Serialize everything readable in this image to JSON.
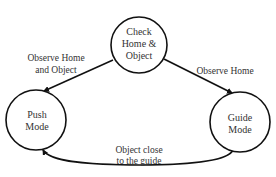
{
  "diagram": {
    "type": "state-machine",
    "nodes": [
      {
        "id": "check",
        "lines": [
          "Check",
          "Home &",
          "Object"
        ],
        "cx": 139,
        "cy": 45,
        "r": 28
      },
      {
        "id": "push",
        "lines": [
          "Push",
          "Mode"
        ],
        "cx": 36,
        "cy": 120,
        "r": 30
      },
      {
        "id": "guide",
        "lines": [
          "Guide",
          "Mode"
        ],
        "cx": 240,
        "cy": 122,
        "r": 30
      }
    ],
    "edges": [
      {
        "from": "check",
        "to": "push",
        "lines": [
          "Observe Home",
          "and Object"
        ]
      },
      {
        "from": "check",
        "to": "guide",
        "lines": [
          "Observe Home"
        ]
      },
      {
        "from": "guide",
        "to": "push",
        "lines": [
          "Object close",
          "to the guide"
        ]
      }
    ],
    "colors": {
      "stroke": "#111111",
      "text": "#333333",
      "background": "#ffffff"
    }
  }
}
